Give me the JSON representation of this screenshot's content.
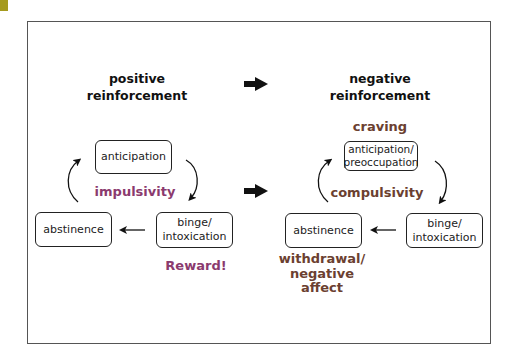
{
  "colors": {
    "corner_tab": "#a59a1e",
    "frame": "#555555",
    "positive_accent": "#8b3a6e",
    "negative_accent": "#6b4030",
    "text": "#111111"
  },
  "positive": {
    "header_line1": "positive",
    "header_line2": "reinforcement",
    "boxes": {
      "anticipation": "anticipation",
      "binge_line1": "binge/",
      "binge_line2": "intoxication",
      "abstinence": "abstinence"
    },
    "labels": {
      "center": "impulsivity",
      "reward": "Reward!"
    }
  },
  "negative": {
    "header_line1": "negative",
    "header_line2": "reinforcement",
    "boxes": {
      "anticipation_line1": "anticipation/",
      "anticipation_line2": "preoccupation",
      "binge_line1": "binge/",
      "binge_line2": "intoxication",
      "abstinence": "abstinence"
    },
    "labels": {
      "top": "craving",
      "center": "compulsivity",
      "withdrawal_line1": "withdrawal/",
      "withdrawal_line2": "negative",
      "withdrawal_line3": "affect"
    }
  },
  "transition_arrows": [
    {
      "from": "positive reinforcement",
      "to": "negative reinforcement",
      "icon": "thick-right-arrow"
    },
    {
      "from": "positive cycle",
      "to": "negative cycle",
      "icon": "thick-right-arrow"
    }
  ]
}
